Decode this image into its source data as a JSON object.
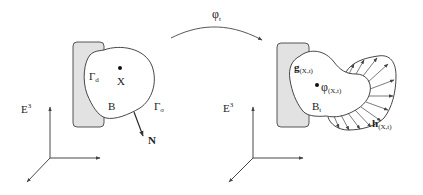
{
  "figure": {
    "colors": {
      "support_fill": "#e2e2e2",
      "stroke": "#333333",
      "background": "#ffffff"
    },
    "mapping": {
      "label": "φ",
      "subscript": "t"
    },
    "reference_configuration": {
      "space_label": "E",
      "space_superscript": "3",
      "body_label": "B",
      "point_label": "X",
      "dirichlet_boundary": {
        "label": "Γ",
        "subscript": "d"
      },
      "neumann_boundary": {
        "label": "Γ",
        "subscript": "σ"
      },
      "normal_label": "N"
    },
    "current_configuration": {
      "space_label": "E",
      "space_superscript": "3",
      "body_label": "B",
      "body_subscript": "t",
      "point_label": "φ",
      "point_subscript": "(X,t)",
      "displacement_bc": {
        "label": "g",
        "subscript": "(X,t)"
      },
      "traction_bc": {
        "label": "h",
        "subscript": "(X,t)"
      }
    }
  }
}
